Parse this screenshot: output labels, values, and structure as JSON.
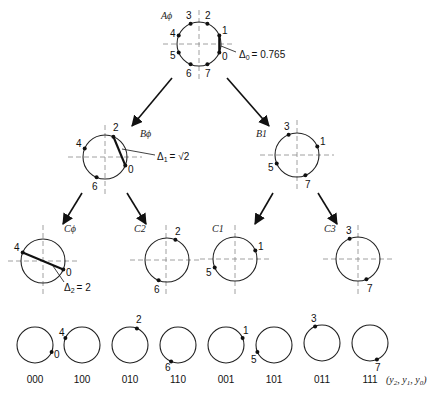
{
  "diagram": {
    "levels": [
      {
        "name": "A",
        "nodes": [
          {
            "id": "A0",
            "label": "Aϕ",
            "points": [
              "0",
              "1",
              "2",
              "3",
              "4",
              "5",
              "6",
              "7"
            ],
            "distance_label": "Δ0 = 0.765",
            "distance_sub": "0",
            "distance_value": "= 0.765"
          }
        ]
      },
      {
        "name": "B",
        "nodes": [
          {
            "id": "B0",
            "label": "Bϕ",
            "points": [
              "0",
              "2",
              "4",
              "6"
            ],
            "distance_label": "Δ1 = √2",
            "distance_sub": "1",
            "distance_value": "= √2"
          },
          {
            "id": "B1",
            "label": "B1",
            "points": [
              "1",
              "3",
              "5",
              "7"
            ]
          }
        ]
      },
      {
        "name": "C",
        "nodes": [
          {
            "id": "C0",
            "label": "Cϕ",
            "points": [
              "0",
              "4"
            ],
            "distance_label": "Δ2 = 2",
            "distance_sub": "2",
            "distance_value": "= 2"
          },
          {
            "id": "C2",
            "label": "C2",
            "points": [
              "2",
              "6"
            ]
          },
          {
            "id": "C1",
            "label": "C1",
            "points": [
              "1",
              "5"
            ]
          },
          {
            "id": "C3",
            "label": "C3",
            "points": [
              "3",
              "7"
            ]
          }
        ]
      }
    ],
    "leaves": [
      {
        "point": "0",
        "code": "000"
      },
      {
        "point": "4",
        "code": "100"
      },
      {
        "point": "2",
        "code": "010"
      },
      {
        "point": "6",
        "code": "110"
      },
      {
        "point": "1",
        "code": "001"
      },
      {
        "point": "5",
        "code": "101"
      },
      {
        "point": "3",
        "code": "011"
      },
      {
        "point": "7",
        "code": "111"
      }
    ],
    "leaf_axis_label": "(y2, y1, y0)",
    "leaf_axis_label_parts": {
      "open": "(y",
      "s2": "2",
      "c1": ", y",
      "s1": "1",
      "c2": ", y",
      "s0": "0",
      "close": ")"
    },
    "delta_symbol": "Δ"
  }
}
